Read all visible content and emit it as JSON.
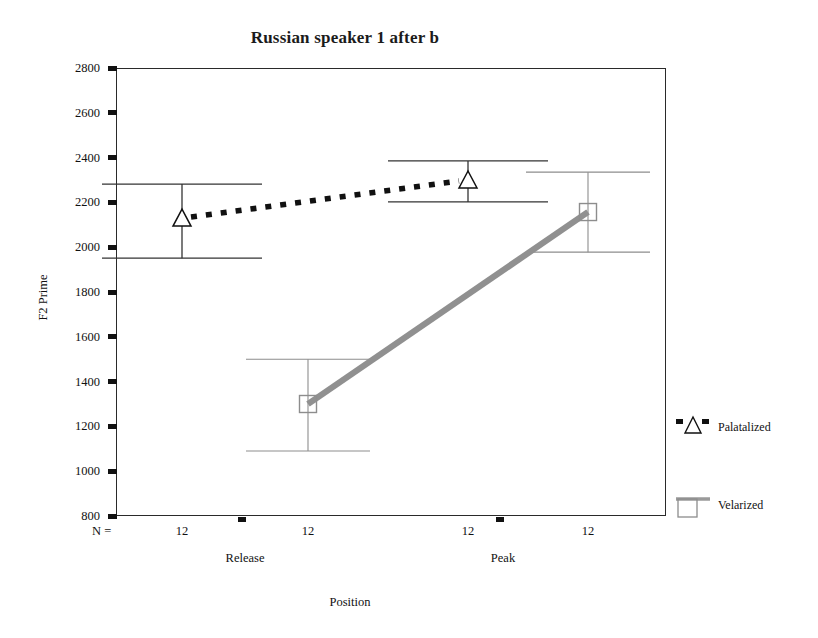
{
  "chart_data": {
    "type": "line",
    "title": "Russian speaker 1 after b",
    "xlabel": "Position",
    "ylabel": "F2 Prime",
    "categories": [
      "Release",
      "Peak"
    ],
    "ylim": [
      800,
      2800
    ],
    "ytick_labels": [
      "2800",
      "2600",
      "2400",
      "2200",
      "2000",
      "1800",
      "1600",
      "1400",
      "1200",
      "1000",
      "800"
    ],
    "ytick_values": [
      2800,
      2600,
      2400,
      2200,
      2000,
      1800,
      1600,
      1400,
      1200,
      1000,
      800
    ],
    "grid": false,
    "legend_position": "right",
    "n_prefix": "N =",
    "n_values": [
      "12",
      "12",
      "12",
      "12"
    ],
    "series": [
      {
        "name": "Palatalized",
        "marker": "open-triangle",
        "line_style": "dotted",
        "color": "#1a1a1a",
        "values": [
          2130,
          2300
        ],
        "error_upper": [
          2282,
          2385
        ],
        "error_lower": [
          1951,
          2202
        ]
      },
      {
        "name": "Velarized",
        "marker": "open-square",
        "line_style": "solid-thick",
        "color": "#8d8d8d",
        "values": [
          1300,
          2157
        ],
        "error_upper": [
          1500,
          2335
        ],
        "error_lower": [
          1090,
          1978
        ]
      }
    ],
    "legend": [
      {
        "label": "Palatalized",
        "marker": "open-triangle",
        "line_style": "dotted",
        "color": "#1a1a1a"
      },
      {
        "label": "Velarized",
        "marker": "open-square",
        "line_style": "solid-thick",
        "color": "#8d8d8d"
      }
    ]
  }
}
